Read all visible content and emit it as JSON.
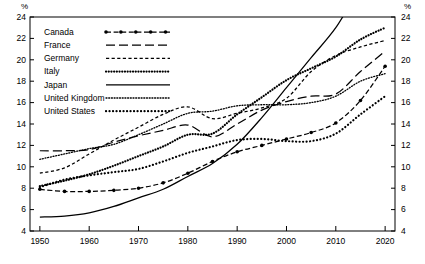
{
  "axis": {
    "unit_label_left": "%",
    "unit_label_right": "%",
    "y_ticks": [
      4,
      6,
      8,
      10,
      12,
      14,
      16,
      18,
      20,
      22,
      24
    ],
    "x_ticks": [
      1950,
      1960,
      1970,
      1980,
      1990,
      2000,
      2010,
      2020
    ],
    "ylim": [
      4,
      24
    ],
    "xlim": [
      1948,
      2022
    ]
  },
  "legend": {
    "items": [
      {
        "label": "Canada",
        "style": "dash-dot-marker"
      },
      {
        "label": "France",
        "style": "long-dash"
      },
      {
        "label": "Germany",
        "style": "short-dash"
      },
      {
        "label": "Italy",
        "style": "dense-dots"
      },
      {
        "label": "Japan",
        "style": "solid"
      },
      {
        "label": "United Kingdom",
        "style": "fine-dots"
      },
      {
        "label": "United States",
        "style": "medium-dots"
      }
    ]
  },
  "chart_data": {
    "type": "line",
    "title": "",
    "xlabel": "",
    "ylabel": "%",
    "xlim": [
      1948,
      2022
    ],
    "ylim": [
      4,
      24
    ],
    "grid": false,
    "legend_position": "top-left-inside",
    "x": [
      1950,
      1955,
      1960,
      1965,
      1970,
      1975,
      1980,
      1985,
      1990,
      1995,
      2000,
      2005,
      2010,
      2015,
      2020
    ],
    "series": [
      {
        "name": "Canada",
        "style": "dash-dot-marker",
        "values": [
          7.9,
          7.7,
          7.7,
          7.8,
          8.0,
          8.5,
          9.4,
          10.5,
          11.4,
          12.0,
          12.6,
          13.2,
          14.1,
          16.2,
          19.4
        ]
      },
      {
        "name": "France",
        "style": "long-dash",
        "values": [
          11.5,
          11.5,
          11.6,
          12.3,
          12.9,
          13.4,
          13.9,
          12.8,
          14.0,
          15.3,
          16.1,
          16.6,
          16.8,
          18.9,
          20.8
        ]
      },
      {
        "name": "Germany",
        "style": "short-dash",
        "values": [
          9.4,
          9.9,
          11.2,
          12.5,
          13.7,
          14.9,
          15.6,
          14.5,
          15.0,
          15.5,
          16.4,
          18.9,
          20.4,
          21.2,
          21.8
        ]
      },
      {
        "name": "Italy",
        "style": "dense-dots",
        "values": [
          8.2,
          8.7,
          9.3,
          10.1,
          11.0,
          11.9,
          13.0,
          13.1,
          14.9,
          16.5,
          18.1,
          19.2,
          20.3,
          21.9,
          23.0
        ]
      },
      {
        "name": "Japan",
        "style": "solid",
        "values": [
          5.3,
          5.4,
          5.7,
          6.3,
          7.1,
          7.9,
          9.1,
          10.3,
          12.1,
          14.6,
          17.4,
          20.2,
          23.0,
          26.7,
          29.1
        ]
      },
      {
        "name": "United Kingdom",
        "style": "fine-dots",
        "values": [
          10.7,
          11.2,
          11.7,
          12.1,
          13.0,
          14.0,
          15.0,
          15.2,
          15.7,
          15.8,
          15.8,
          16.0,
          16.6,
          18.0,
          18.7
        ]
      },
      {
        "name": "United States",
        "style": "medium-dots",
        "values": [
          8.1,
          8.8,
          9.2,
          9.5,
          9.8,
          10.5,
          11.3,
          11.9,
          12.5,
          12.6,
          12.4,
          12.4,
          13.1,
          14.9,
          16.6
        ]
      }
    ],
    "note": "Share of population aged 65 and over, 1950-2020, seven countries."
  }
}
